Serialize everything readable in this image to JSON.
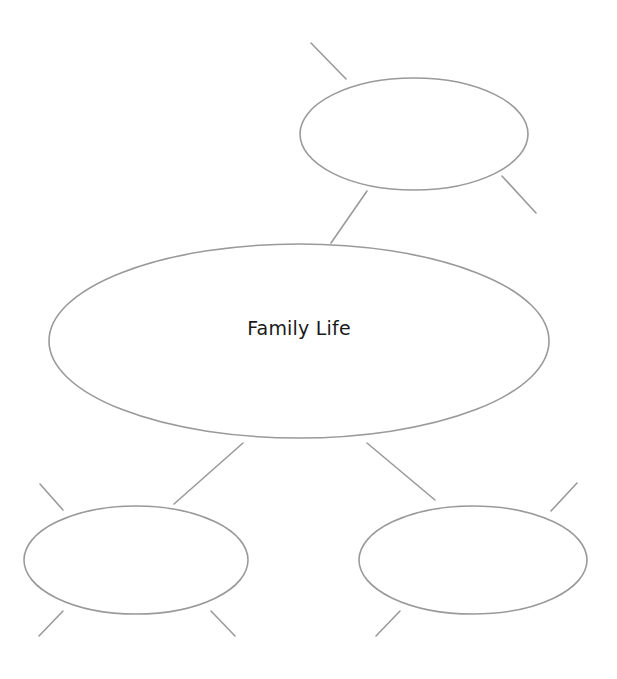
{
  "diagram": {
    "type": "mind-map",
    "stroke_color": "#9a9a9a",
    "central_node": {
      "label": "Family Life",
      "cx": 299,
      "cy": 341,
      "rx": 250,
      "ry": 97
    },
    "nodes": [
      {
        "id": "top-right",
        "label": "",
        "cx": 414,
        "cy": 134,
        "rx": 114,
        "ry": 56
      },
      {
        "id": "bottom-left",
        "label": "",
        "cx": 136,
        "cy": 560,
        "rx": 112,
        "ry": 54
      },
      {
        "id": "bottom-right",
        "label": "",
        "cx": 473,
        "cy": 560,
        "rx": 114,
        "ry": 54
      }
    ]
  }
}
